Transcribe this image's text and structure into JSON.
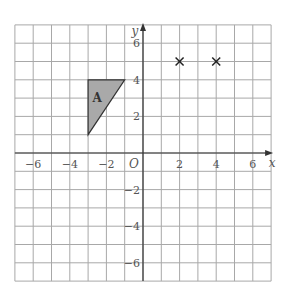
{
  "chart_data": {
    "type": "scatter",
    "title": "",
    "xlabel": "x",
    "ylabel": "y",
    "origin_label": "O",
    "xlim": [
      -7,
      7
    ],
    "ylim": [
      -7,
      7
    ],
    "grid": true,
    "x_ticks": [
      -6,
      -4,
      -2,
      2,
      4,
      6
    ],
    "y_ticks": [
      6,
      4,
      2,
      -2,
      -4,
      -6
    ],
    "x_tick_labels": [
      "−6",
      "−4",
      "−2",
      "2",
      "4",
      "6"
    ],
    "y_tick_labels": [
      "6",
      "4",
      "2",
      "−2",
      "−4",
      "−6"
    ],
    "shapes": [
      {
        "name": "A",
        "type": "triangle",
        "vertices": [
          [
            -3,
            4
          ],
          [
            -1,
            4
          ],
          [
            -3,
            1
          ]
        ],
        "fill": "#a9a9a9",
        "label_pos": [
          -2.5,
          3
        ]
      }
    ],
    "points": [
      {
        "x": 2,
        "y": 5,
        "marker": "x"
      },
      {
        "x": 4,
        "y": 5,
        "marker": "x"
      }
    ]
  },
  "colors": {
    "grid": "#a8a8a8",
    "axis": "#333333",
    "shape_fill": "#a9a9a9",
    "text": "#555555"
  }
}
